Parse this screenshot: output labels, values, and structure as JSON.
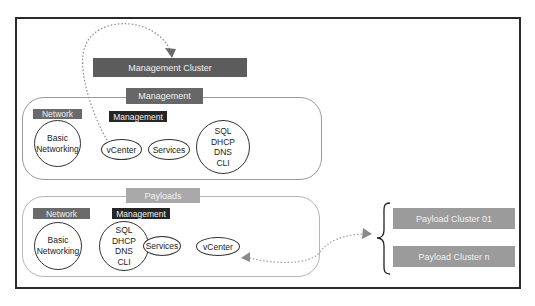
{
  "diagram": {
    "management_cluster": {
      "label": "Management Cluster",
      "color": "#5c5c5c"
    },
    "management_group": {
      "title": "Management",
      "title_color": "#676767",
      "network_label": "Network",
      "management_label": "Management",
      "basic_networking": "Basic\nNetworking",
      "vcenter": "vCenter",
      "services": "Services",
      "infra_services": "SQL\nDHCP\nDNS\nCLI"
    },
    "payloads_group": {
      "title": "Payloads",
      "title_color": "#a9a9a9",
      "network_label": "Network",
      "management_label": "Management",
      "basic_networking": "Basic\nNetworking",
      "infra_services": "SQL\nDHCP\nDNS\nCLI",
      "services": "Services",
      "vcenter": "vCenter"
    },
    "payload_clusters": [
      {
        "label": "Payload Cluster 01"
      },
      {
        "label": "Payload Cluster n"
      }
    ],
    "colors": {
      "network_label": "#6a6a6a",
      "management_label": "#262626",
      "payload_cluster": "#9b9b9b",
      "arrow": "#8a8a8a"
    }
  }
}
